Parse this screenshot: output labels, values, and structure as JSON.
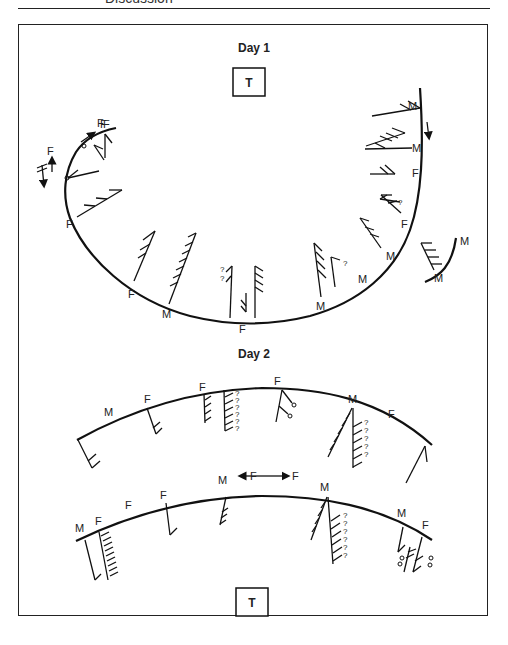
{
  "page_header": {
    "section_title": "Discussion"
  },
  "day1": {
    "title": "Day 1",
    "tee_label": "T",
    "labels": [
      {
        "text": "F",
        "x": 100,
        "y": 124
      },
      {
        "text": "F",
        "x": 133,
        "y": 126
      },
      {
        "text": "F",
        "x": 62,
        "y": 148
      },
      {
        "text": "F",
        "x": 67,
        "y": 227
      },
      {
        "text": "F",
        "x": 129,
        "y": 297
      },
      {
        "text": "M",
        "x": 164,
        "y": 316
      },
      {
        "text": "F",
        "x": 241,
        "y": 331
      },
      {
        "text": "M",
        "x": 317,
        "y": 307
      },
      {
        "text": "M",
        "x": 358,
        "y": 280
      },
      {
        "text": "M",
        "x": 387,
        "y": 258
      },
      {
        "text": "F",
        "x": 403,
        "y": 227
      },
      {
        "text": "F",
        "x": 413,
        "y": 176
      },
      {
        "text": "M",
        "x": 413,
        "y": 150
      },
      {
        "text": "M",
        "x": 410,
        "y": 108
      },
      {
        "text": "M",
        "x": 461,
        "y": 243
      },
      {
        "text": "M",
        "x": 435,
        "y": 282
      }
    ],
    "question_marks": [
      {
        "text": "?",
        "x": 228,
        "y": 271
      },
      {
        "text": "?",
        "x": 228,
        "y": 280
      },
      {
        "text": "?",
        "x": 343,
        "y": 265
      },
      {
        "text": "?",
        "x": 397,
        "y": 204
      }
    ]
  },
  "day2": {
    "title": "Day 2",
    "tee_label": "T",
    "upper_labels": [
      {
        "text": "M",
        "x": 106,
        "y": 417
      },
      {
        "text": "F",
        "x": 146,
        "y": 402
      },
      {
        "text": "F",
        "x": 200,
        "y": 390
      },
      {
        "text": "F",
        "x": 274,
        "y": 385
      },
      {
        "text": "M",
        "x": 349,
        "y": 402
      },
      {
        "text": "F",
        "x": 389,
        "y": 417
      }
    ],
    "lower_labels": [
      {
        "text": "M",
        "x": 76,
        "y": 531
      },
      {
        "text": "F",
        "x": 95,
        "y": 525
      },
      {
        "text": "F",
        "x": 126,
        "y": 508
      },
      {
        "text": "F",
        "x": 160,
        "y": 498
      },
      {
        "text": "M",
        "x": 218,
        "y": 483
      },
      {
        "text": "F",
        "x": 250,
        "y": 483
      },
      {
        "text": "F",
        "x": 298,
        "y": 483
      },
      {
        "text": "M",
        "x": 320,
        "y": 490
      },
      {
        "text": "M",
        "x": 397,
        "y": 516
      },
      {
        "text": "F",
        "x": 423,
        "y": 528
      }
    ],
    "question_marks_upper": [
      "?",
      "?",
      "?",
      "?",
      "?",
      "?"
    ],
    "question_marks_right": [
      "?",
      "?",
      "?",
      "?",
      "?"
    ],
    "question_marks_lower": [
      "?",
      "?",
      "?",
      "?",
      "?",
      "?"
    ]
  }
}
